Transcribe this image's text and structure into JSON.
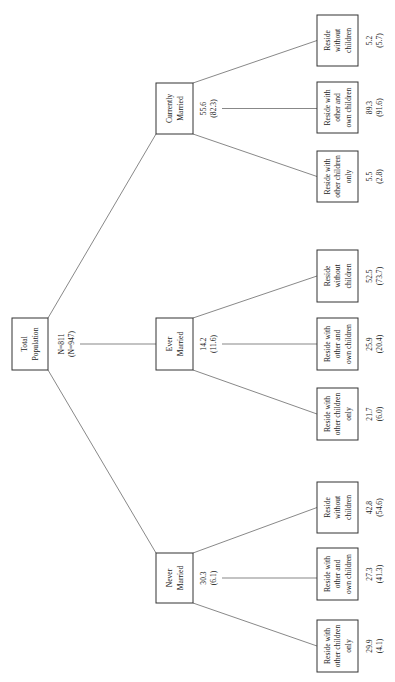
{
  "diagram": {
    "orientation": "rotated-90-ccw",
    "root": {
      "label_lines": [
        "Total",
        "Population"
      ],
      "stats_lines": [
        "N=811",
        "(N=947)"
      ]
    },
    "branches": [
      {
        "id": "currently-married",
        "label_lines": [
          "Currently",
          "Married"
        ],
        "stats_lines": [
          "55.6",
          "(82.3)"
        ],
        "children": [
          {
            "label_lines": [
              "Reside with",
              "other children",
              "only"
            ],
            "stats_lines": [
              "5.5",
              "(2.8)"
            ]
          },
          {
            "label_lines": [
              "Reside with",
              "other and",
              "own children"
            ],
            "stats_lines": [
              "89.3",
              "(91.6)"
            ]
          },
          {
            "label_lines": [
              "Reside",
              "without",
              "children"
            ],
            "stats_lines": [
              "5.2",
              "(5.7)"
            ]
          }
        ]
      },
      {
        "id": "ever-married",
        "label_lines": [
          "Ever",
          "Married"
        ],
        "stats_lines": [
          "14.2",
          "(11.6)"
        ],
        "children": [
          {
            "label_lines": [
              "Reside with",
              "other children",
              "only"
            ],
            "stats_lines": [
              "21.7",
              "(6.0)"
            ]
          },
          {
            "label_lines": [
              "Reside with",
              "other and",
              "own children"
            ],
            "stats_lines": [
              "25.9",
              "(20.4)"
            ]
          },
          {
            "label_lines": [
              "Reside",
              "without",
              "children"
            ],
            "stats_lines": [
              "52.5",
              "(73.7)"
            ]
          }
        ]
      },
      {
        "id": "never-married",
        "label_lines": [
          "Never",
          "Married"
        ],
        "stats_lines": [
          "30.3",
          "(6.1)"
        ],
        "children": [
          {
            "label_lines": [
              "Reside with",
              "other children",
              "only"
            ],
            "stats_lines": [
              "29.9",
              "(4.1)"
            ]
          },
          {
            "label_lines": [
              "Reside with",
              "other and",
              "own children"
            ],
            "stats_lines": [
              "27.3",
              "(41.3)"
            ]
          },
          {
            "label_lines": [
              "Reside",
              "without",
              "children"
            ],
            "stats_lines": [
              "42.8",
              "(54.6)"
            ]
          }
        ]
      }
    ]
  },
  "colors": {
    "line": "#555555",
    "box_border": "#333333",
    "text": "#222222",
    "background": "#ffffff"
  }
}
